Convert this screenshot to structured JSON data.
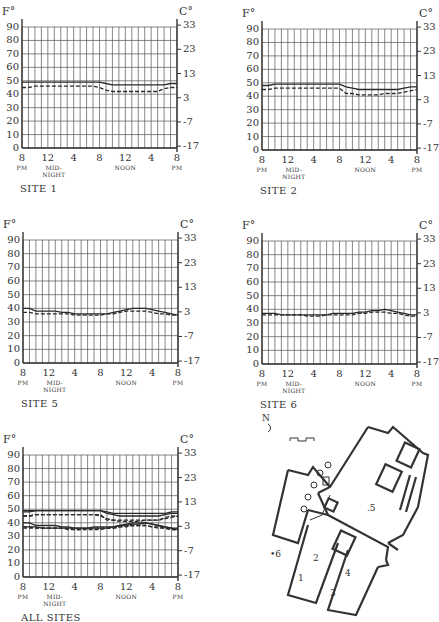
{
  "figure": {
    "left_unit": "F°",
    "right_unit": "C°",
    "f_ticks": [
      "90",
      "80",
      "70",
      "60",
      "50",
      "40",
      "30",
      "20",
      "10",
      "0"
    ],
    "c_ticks": [
      "33",
      "23",
      "13",
      "3",
      "-7",
      "-17"
    ],
    "x_ticks": [
      {
        "main": "8",
        "sub": "PM"
      },
      {
        "main": "12",
        "sub": "MID-\nNIGHT"
      },
      {
        "main": "4",
        "sub": ""
      },
      {
        "main": "8",
        "sub": ""
      },
      {
        "main": "12",
        "sub": "NOON"
      },
      {
        "main": "4",
        "sub": ""
      },
      {
        "main": "8",
        "sub": "PM"
      }
    ],
    "colors": {
      "grid": "#555555",
      "axis": "#333333",
      "series": "#2a2a2a"
    }
  },
  "panels": [
    {
      "id": "site1",
      "title": "SITE 1"
    },
    {
      "id": "site2",
      "title": "SITE 2"
    },
    {
      "id": "site5",
      "title": "SITE 5"
    },
    {
      "id": "site6",
      "title": "SITE 6"
    },
    {
      "id": "all",
      "title": "ALL SITES"
    }
  ],
  "plan": {
    "north_label": "N",
    "labels": [
      "1",
      "2",
      "3",
      "4",
      ".5",
      "•6"
    ]
  },
  "chart_data": [
    {
      "type": "line",
      "title": "SITE 1",
      "xlabel": "",
      "ylabel": "F°",
      "y2label": "C°",
      "ylim": [
        0,
        90
      ],
      "y2ticks": [
        -17,
        -7,
        3,
        13,
        23,
        33
      ],
      "x": [
        "8PM",
        "9",
        "10",
        "11",
        "12 MIDNIGHT",
        "1",
        "2",
        "3",
        "4",
        "5",
        "6",
        "7",
        "8",
        "9",
        "10",
        "11",
        "12 NOON",
        "1",
        "2",
        "3",
        "4",
        "5",
        "6",
        "7",
        "8PM"
      ],
      "series": [
        {
          "name": "solid",
          "style": "solid",
          "values": [
            49,
            49,
            49,
            49,
            49,
            49,
            49,
            49,
            49,
            49,
            49,
            49,
            49,
            48,
            47,
            47,
            47,
            47,
            47,
            47,
            47,
            47,
            47,
            48,
            48
          ]
        },
        {
          "name": "dashed",
          "style": "dashed",
          "values": [
            45,
            45,
            46,
            46,
            46,
            46,
            46,
            46,
            46,
            46,
            46,
            46,
            45,
            43,
            42,
            42,
            42,
            42,
            42,
            42,
            42,
            42,
            44,
            45,
            45
          ]
        }
      ],
      "grid": true
    },
    {
      "type": "line",
      "title": "SITE 2",
      "xlabel": "",
      "ylabel": "F°",
      "y2label": "C°",
      "ylim": [
        0,
        90
      ],
      "y2ticks": [
        -17,
        -7,
        3,
        13,
        23,
        33
      ],
      "x": [
        "8PM",
        "9",
        "10",
        "11",
        "12 MIDNIGHT",
        "1",
        "2",
        "3",
        "4",
        "5",
        "6",
        "7",
        "8",
        "9",
        "10",
        "11",
        "12 NOON",
        "1",
        "2",
        "3",
        "4",
        "5",
        "6",
        "7",
        "8PM"
      ],
      "series": [
        {
          "name": "solid",
          "style": "solid",
          "values": [
            48,
            48,
            49,
            49,
            49,
            49,
            49,
            49,
            49,
            49,
            49,
            49,
            49,
            47,
            46,
            45,
            45,
            45,
            45,
            45,
            45,
            45,
            46,
            47,
            47
          ]
        },
        {
          "name": "dashed",
          "style": "dashed",
          "values": [
            45,
            45,
            46,
            46,
            46,
            46,
            46,
            46,
            46,
            46,
            46,
            46,
            46,
            42,
            42,
            41,
            41,
            41,
            41,
            42,
            42,
            42,
            43,
            44,
            45
          ]
        }
      ],
      "grid": true
    },
    {
      "type": "line",
      "title": "SITE 5",
      "xlabel": "",
      "ylabel": "F°",
      "y2label": "C°",
      "ylim": [
        0,
        90
      ],
      "y2ticks": [
        -17,
        -7,
        3,
        13,
        23,
        33
      ],
      "x": [
        "8PM",
        "9",
        "10",
        "11",
        "12 MIDNIGHT",
        "1",
        "2",
        "3",
        "4",
        "5",
        "6",
        "7",
        "8",
        "9",
        "10",
        "11",
        "12 NOON",
        "1",
        "2",
        "3",
        "4",
        "5",
        "6",
        "7",
        "8PM"
      ],
      "series": [
        {
          "name": "solid",
          "style": "solid",
          "values": [
            40,
            40,
            38,
            38,
            38,
            38,
            37,
            37,
            36,
            36,
            36,
            36,
            36,
            36,
            37,
            38,
            39,
            40,
            40,
            40,
            39,
            38,
            37,
            36,
            35
          ]
        },
        {
          "name": "dashed",
          "style": "dashed",
          "values": [
            37,
            37,
            36,
            36,
            36,
            36,
            36,
            36,
            35,
            35,
            35,
            35,
            35,
            36,
            36,
            37,
            38,
            38,
            38,
            38,
            37,
            36,
            36,
            35,
            35
          ]
        }
      ],
      "grid": true
    },
    {
      "type": "line",
      "title": "SITE 6",
      "xlabel": "",
      "ylabel": "F°",
      "y2label": "C°",
      "ylim": [
        0,
        90
      ],
      "y2ticks": [
        -17,
        -7,
        3,
        13,
        23,
        33
      ],
      "x": [
        "8PM",
        "9",
        "10",
        "11",
        "12 MIDNIGHT",
        "1",
        "2",
        "3",
        "4",
        "5",
        "6",
        "7",
        "8",
        "9",
        "10",
        "11",
        "12 NOON",
        "1",
        "2",
        "3",
        "4",
        "5",
        "6",
        "7",
        "8PM"
      ],
      "series": [
        {
          "name": "solid",
          "style": "solid",
          "values": [
            37,
            37,
            37,
            36,
            36,
            36,
            36,
            36,
            36,
            36,
            36,
            37,
            37,
            37,
            37,
            38,
            38,
            39,
            39,
            40,
            39,
            38,
            37,
            36,
            36
          ]
        },
        {
          "name": "dashed",
          "style": "dashed",
          "values": [
            36,
            36,
            36,
            36,
            36,
            36,
            36,
            35,
            35,
            35,
            36,
            36,
            36,
            36,
            36,
            37,
            37,
            38,
            38,
            38,
            37,
            37,
            36,
            35,
            35
          ]
        }
      ],
      "grid": true
    },
    {
      "type": "line",
      "title": "ALL SITES",
      "xlabel": "",
      "ylabel": "F°",
      "y2label": "C°",
      "ylim": [
        0,
        90
      ],
      "y2ticks": [
        -17,
        -7,
        3,
        13,
        23,
        33
      ],
      "x": [
        "8PM",
        "9",
        "10",
        "11",
        "12 MIDNIGHT",
        "1",
        "2",
        "3",
        "4",
        "5",
        "6",
        "7",
        "8",
        "9",
        "10",
        "11",
        "12 NOON",
        "1",
        "2",
        "3",
        "4",
        "5",
        "6",
        "7",
        "8PM"
      ],
      "series": [
        {
          "name": "site1-solid",
          "style": "solid",
          "values": [
            49,
            49,
            49,
            49,
            49,
            49,
            49,
            49,
            49,
            49,
            49,
            49,
            49,
            48,
            47,
            47,
            47,
            47,
            47,
            47,
            47,
            47,
            47,
            48,
            48
          ]
        },
        {
          "name": "site1-dashed",
          "style": "dashed",
          "values": [
            45,
            45,
            46,
            46,
            46,
            46,
            46,
            46,
            46,
            46,
            46,
            46,
            45,
            43,
            42,
            42,
            42,
            42,
            42,
            42,
            42,
            42,
            44,
            45,
            45
          ]
        },
        {
          "name": "site2-solid",
          "style": "solid",
          "values": [
            48,
            48,
            49,
            49,
            49,
            49,
            49,
            49,
            49,
            49,
            49,
            49,
            49,
            47,
            46,
            45,
            45,
            45,
            45,
            45,
            45,
            45,
            46,
            47,
            47
          ]
        },
        {
          "name": "site2-dashed",
          "style": "dashed",
          "values": [
            45,
            45,
            46,
            46,
            46,
            46,
            46,
            46,
            46,
            46,
            46,
            46,
            46,
            42,
            42,
            41,
            41,
            41,
            41,
            42,
            42,
            42,
            43,
            44,
            45
          ]
        },
        {
          "name": "site5-solid",
          "style": "solid",
          "values": [
            40,
            40,
            38,
            38,
            38,
            38,
            37,
            37,
            36,
            36,
            36,
            36,
            36,
            36,
            37,
            38,
            39,
            40,
            40,
            40,
            39,
            38,
            37,
            36,
            35
          ]
        },
        {
          "name": "site5-dashed",
          "style": "dashed",
          "values": [
            37,
            37,
            36,
            36,
            36,
            36,
            36,
            36,
            35,
            35,
            35,
            35,
            35,
            36,
            36,
            37,
            38,
            38,
            38,
            38,
            37,
            36,
            36,
            35,
            35
          ]
        },
        {
          "name": "site6-solid",
          "style": "solid",
          "values": [
            37,
            37,
            37,
            36,
            36,
            36,
            36,
            36,
            36,
            36,
            36,
            37,
            37,
            37,
            37,
            38,
            38,
            39,
            39,
            40,
            39,
            38,
            37,
            36,
            36
          ]
        },
        {
          "name": "site6-dashed",
          "style": "dashed",
          "values": [
            36,
            36,
            36,
            36,
            36,
            36,
            36,
            35,
            35,
            35,
            36,
            36,
            36,
            36,
            36,
            37,
            37,
            38,
            38,
            38,
            37,
            37,
            36,
            35,
            35
          ]
        }
      ],
      "grid": true
    }
  ]
}
